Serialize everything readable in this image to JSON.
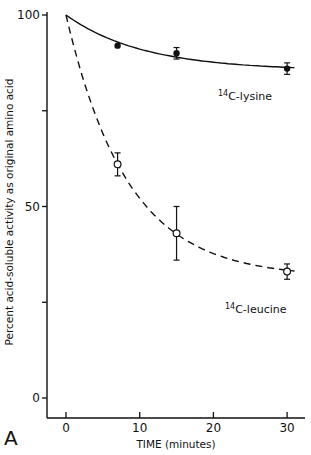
{
  "chart_data": {
    "type": "line",
    "title": "",
    "panel_label": "A",
    "xlabel": "TIME (minutes)",
    "ylabel": "Percent acid-soluble activity as original amino acid",
    "xlim": [
      -3,
      32
    ],
    "ylim": [
      -5,
      100
    ],
    "x_ticks": [
      0,
      10,
      20,
      30
    ],
    "x_tick_labels": [
      "0",
      "10",
      "20",
      "30"
    ],
    "y_ticks": [
      0,
      25,
      50,
      75,
      100
    ],
    "y_tick_labels": [
      "0",
      "",
      "50",
      "",
      "100"
    ],
    "grid": false,
    "legend": "inline labels",
    "series": [
      {
        "name": "14C-lysine",
        "label_sup": "14",
        "label_rest": "C-lysine",
        "marker": "filled-circle",
        "line_style": "solid",
        "x": [
          7,
          15,
          30
        ],
        "values": [
          92,
          90,
          86
        ],
        "error": [
          0.5,
          1.5,
          1.5
        ],
        "fit_start": [
          0,
          100
        ]
      },
      {
        "name": "14C-leucine",
        "label_sup": "14",
        "label_rest": "C-leucine",
        "marker": "open-circle",
        "line_style": "dashed",
        "x": [
          7,
          15,
          30
        ],
        "values": [
          61,
          43,
          33
        ],
        "error": [
          3,
          7,
          2
        ],
        "fit_start": [
          0,
          100
        ]
      }
    ]
  }
}
